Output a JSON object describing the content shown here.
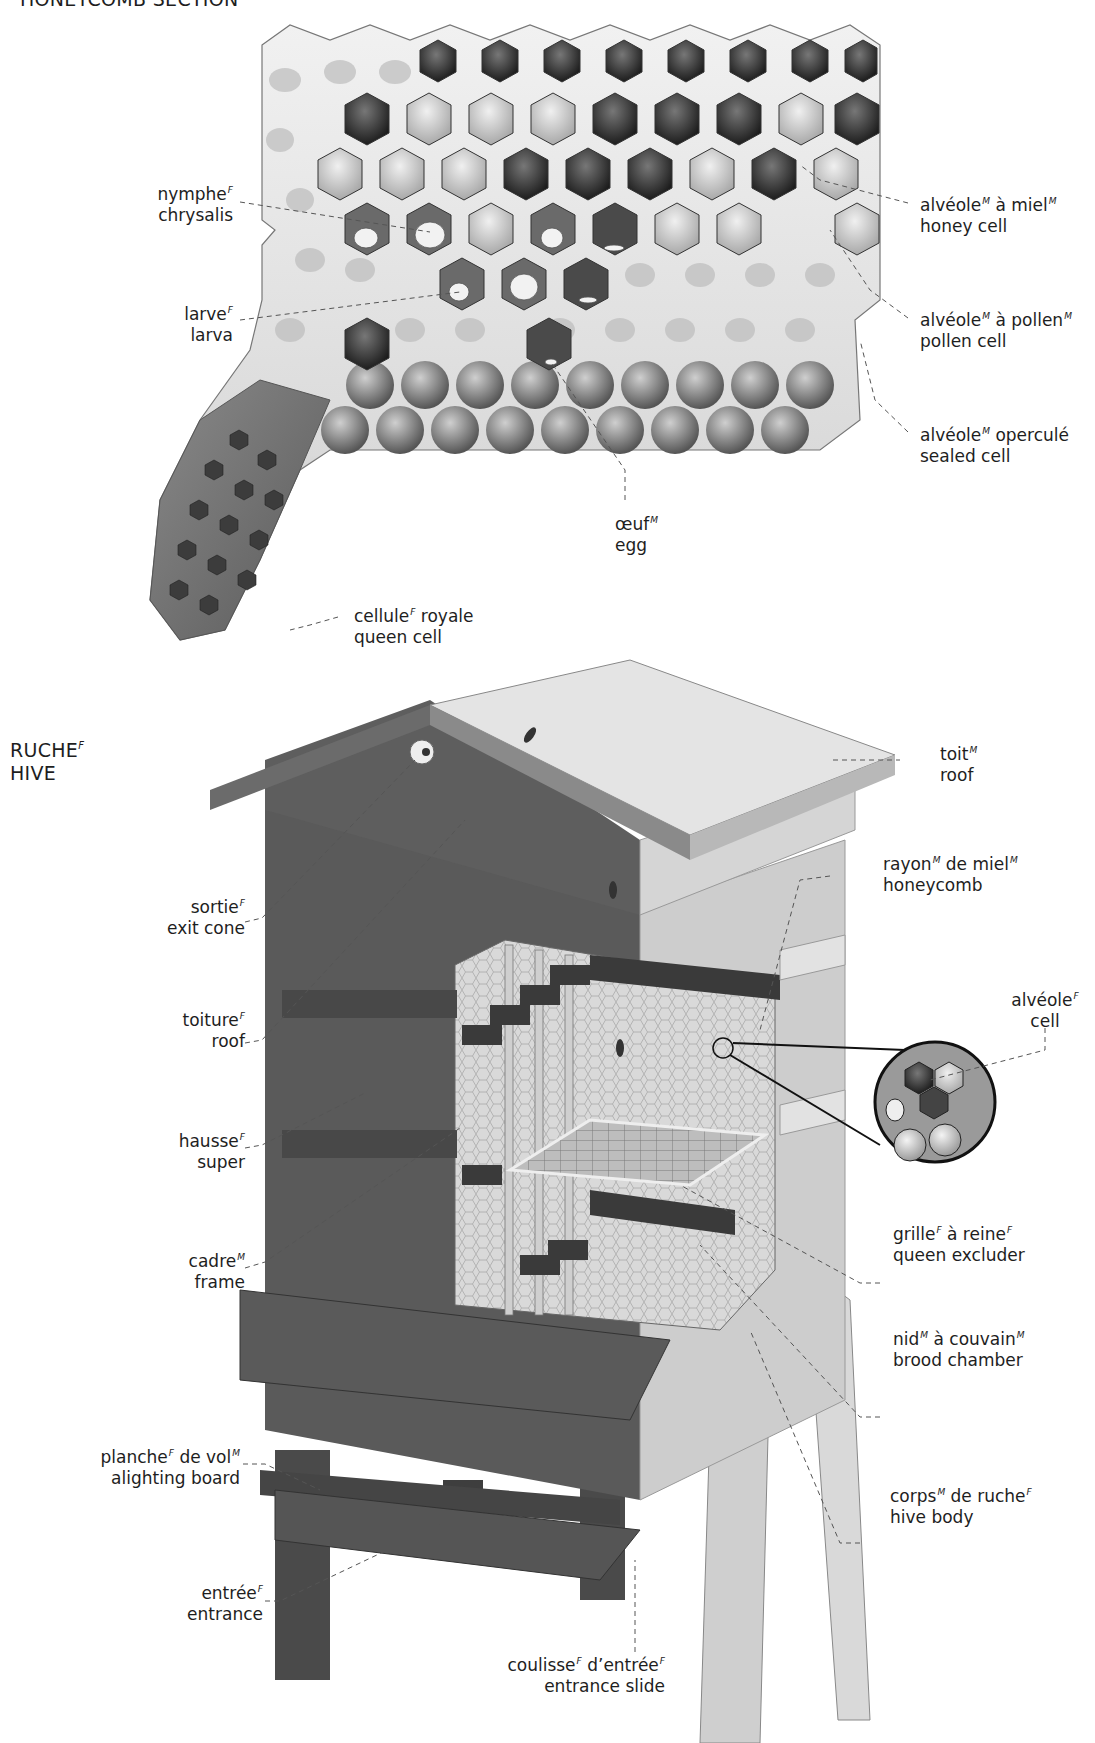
{
  "sections": {
    "honeycomb": {
      "title": "HONEYCOMB SECTION"
    },
    "hive": {
      "title_fr": "RUCHE",
      "title_fr_gender": "F",
      "title_en": "HIVE"
    }
  },
  "honeycomb_labels": [
    {
      "id": "chrysalis",
      "fr": "nymphe",
      "g": "F",
      "fr2": "",
      "g2": "",
      "en": "chrysalis"
    },
    {
      "id": "larva",
      "fr": "larve",
      "g": "F",
      "fr2": "",
      "g2": "",
      "en": "larva"
    },
    {
      "id": "honey-cell",
      "fr": "alvéole",
      "g": "M",
      "fr2": " à miel",
      "g2": "M",
      "en": "honey cell"
    },
    {
      "id": "pollen-cell",
      "fr": "alvéole",
      "g": "M",
      "fr2": " à pollen",
      "g2": "M",
      "en": "pollen cell"
    },
    {
      "id": "sealed-cell",
      "fr": "alvéole",
      "g": "M",
      "fr2": " operculé",
      "g2": "",
      "en": "sealed cell"
    },
    {
      "id": "egg",
      "fr": "œuf",
      "g": "M",
      "fr2": "",
      "g2": "",
      "en": "egg"
    },
    {
      "id": "queen-cell",
      "fr": "cellule",
      "g": "F",
      "fr2": " royale",
      "g2": "",
      "en": "queen cell"
    }
  ],
  "hive_labels": [
    {
      "id": "roof",
      "fr": "toit",
      "g": "M",
      "fr2": "",
      "g2": "",
      "en": "roof"
    },
    {
      "id": "honeycomb",
      "fr": "rayon",
      "g": "M",
      "fr2": " de miel",
      "g2": "M",
      "en": "honeycomb"
    },
    {
      "id": "exit-cone",
      "fr": "sortie",
      "g": "F",
      "fr2": "",
      "g2": "",
      "en": "exit cone"
    },
    {
      "id": "cell",
      "fr": "alvéole",
      "g": "F",
      "fr2": "",
      "g2": "",
      "en": "cell"
    },
    {
      "id": "toiture",
      "fr": "toiture",
      "g": "F",
      "fr2": "",
      "g2": "",
      "en": "roof"
    },
    {
      "id": "super",
      "fr": "hausse",
      "g": "F",
      "fr2": "",
      "g2": "",
      "en": "super"
    },
    {
      "id": "frame",
      "fr": "cadre",
      "g": "M",
      "fr2": "",
      "g2": "",
      "en": "frame"
    },
    {
      "id": "queen-excluder",
      "fr": "grille",
      "g": "F",
      "fr2": " à reine",
      "g2": "F",
      "en": "queen excluder"
    },
    {
      "id": "brood-chamber",
      "fr": "nid",
      "g": "M",
      "fr2": " à couvain",
      "g2": "M",
      "en": "brood chamber"
    },
    {
      "id": "alighting-board",
      "fr": "planche",
      "g": "F",
      "fr2": " de vol",
      "g2": "M",
      "en": "alighting board"
    },
    {
      "id": "hive-body",
      "fr": "corps",
      "g": "M",
      "fr2": " de ruche",
      "g2": "F",
      "en": "hive body"
    },
    {
      "id": "entrance",
      "fr": "entrée",
      "g": "F",
      "fr2": "",
      "g2": "",
      "en": "entrance"
    },
    {
      "id": "entrance-slide",
      "fr": "coulisse",
      "g": "F",
      "fr2": " d’entrée",
      "g2": "F",
      "en": "entrance slide"
    }
  ]
}
